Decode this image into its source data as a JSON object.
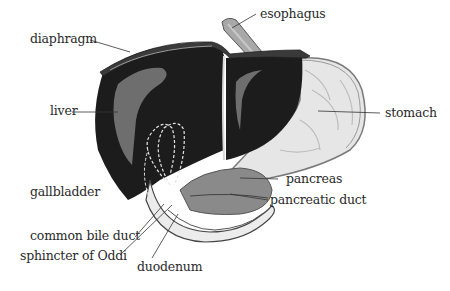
{
  "diagram": {
    "type": "anatomical-illustration",
    "colors": {
      "liver": "#1c1c1c",
      "liver_highlight": "#6e6e6e",
      "diaphragm": "#3a3a3a",
      "stomach": "#e6e6e6",
      "stomach_outline": "#7a7a7a",
      "esophagus": "#a8a8a8",
      "pancreas": "#8a8a8a",
      "duodenum": "#ececec",
      "leader_line": "#333333",
      "label_text": "#2a2a2a"
    },
    "labels": [
      {
        "id": "esophagus",
        "text": "esophagus"
      },
      {
        "id": "diaphragm",
        "text": "diaphragm"
      },
      {
        "id": "liver",
        "text": "liver"
      },
      {
        "id": "stomach",
        "text": "stomach"
      },
      {
        "id": "gallbladder",
        "text": "gallbladder"
      },
      {
        "id": "pancreas",
        "text": "pancreas"
      },
      {
        "id": "pancreatic_duct",
        "text": "pancreatic duct"
      },
      {
        "id": "common_bile_duct",
        "text": "common bile duct"
      },
      {
        "id": "sphincter_of_oddi",
        "text": "sphincter of Oddi"
      },
      {
        "id": "duodenum",
        "text": "duodenum"
      }
    ]
  }
}
